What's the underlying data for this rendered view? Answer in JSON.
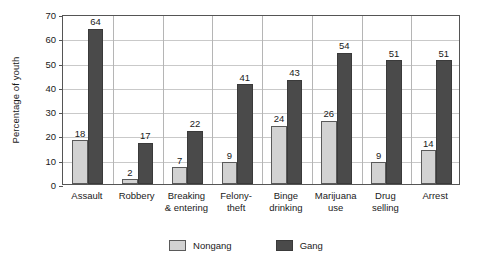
{
  "chart_data": {
    "type": "bar",
    "title": "",
    "subtitle": "",
    "xlabel": "",
    "ylabel": "Percentage of youth",
    "ylim": [
      0,
      70
    ],
    "ytick_values": [
      0,
      10,
      20,
      30,
      40,
      50,
      60,
      70
    ],
    "ytick_labels": [
      "0",
      "10",
      "20",
      "30",
      "40",
      "50",
      "60",
      "70"
    ],
    "grid": true,
    "grid_axis": "y",
    "legend_position": "bottom-center",
    "categories": [
      "Assault",
      "Robbery",
      "Breaking\n& entering",
      "Felony-\ntheft",
      "Binge\ndrinking",
      "Marijuana\nuse",
      "Drug\nselling",
      "Arrest"
    ],
    "category_lines": [
      [
        "Assault"
      ],
      [
        "Robbery"
      ],
      [
        "Breaking",
        "& entering"
      ],
      [
        "Felony-",
        "theft"
      ],
      [
        "Binge",
        "drinking"
      ],
      [
        "Marijuana",
        "use"
      ],
      [
        "Drug",
        "selling"
      ],
      [
        "Arrest"
      ]
    ],
    "series": [
      {
        "name": "Nongang",
        "color": "#d2d2d2",
        "values": [
          18,
          2,
          7,
          9,
          24,
          26,
          9,
          14
        ]
      },
      {
        "name": "Gang",
        "color": "#4a4a4a",
        "values": [
          64,
          17,
          22,
          41,
          43,
          54,
          51,
          51
        ]
      }
    ]
  },
  "legend": {
    "items": [
      {
        "label": "Nongang",
        "swatch": "nongang-swatch"
      },
      {
        "label": "Gang",
        "swatch": "gang-swatch"
      }
    ]
  }
}
